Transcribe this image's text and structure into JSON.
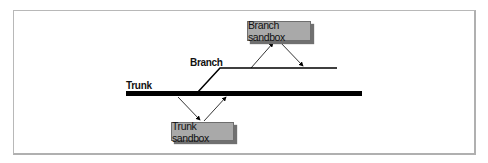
{
  "diagram": {
    "labels": {
      "trunk": "Trunk",
      "branch": "Branch"
    },
    "boxes": {
      "branch_sandbox": "Branch sandbox",
      "trunk_sandbox": "Trunk sandbox"
    },
    "colors": {
      "line": "#000000",
      "box_fill": "#a9a9a9",
      "box_shadow": "#707070",
      "frame": "#b8b8b8"
    }
  }
}
